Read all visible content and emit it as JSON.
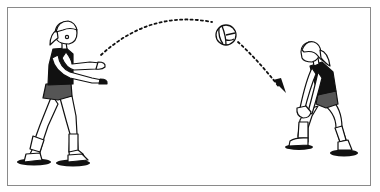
{
  "illustration": {
    "subject": "volleyball-toss-and-forearm-pass-drill",
    "elements": [
      {
        "name": "tossing-player",
        "role": "tosser"
      },
      {
        "name": "passing-player",
        "role": "passer"
      },
      {
        "name": "volleyball",
        "role": "ball"
      },
      {
        "name": "trajectory-arrow",
        "role": "dotted-ball-path"
      }
    ]
  },
  "colors": {
    "ink": "#111111",
    "frame": "#8a8a8a",
    "shorts": "#555555",
    "background": "#ffffff"
  }
}
